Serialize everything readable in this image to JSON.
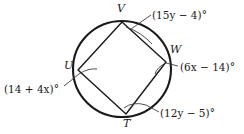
{
  "figure": {
    "shape": "cyclic quadrilateral UVWT inscribed in a circle",
    "stroke_color": "#1a1a1a",
    "background_color": "#ffffff"
  },
  "vertices": [
    {
      "name": "V",
      "label": "V",
      "x": 122,
      "y": 22
    },
    {
      "name": "W",
      "label": "W",
      "x": 166,
      "y": 62
    },
    {
      "name": "T",
      "label": "T",
      "x": 126,
      "y": 114
    },
    {
      "name": "U",
      "label": "U",
      "x": 78,
      "y": 70
    }
  ],
  "vertex_label_positions": [
    {
      "name": "V",
      "left": 117,
      "top": 3
    },
    {
      "name": "W",
      "left": 170,
      "top": 44
    },
    {
      "name": "T",
      "left": 123,
      "top": 118
    },
    {
      "name": "U",
      "left": 64,
      "top": 60
    }
  ],
  "angle_labels": [
    {
      "id": "angle-v",
      "text": "(15y − 4)°",
      "expression": "15y - 4",
      "vertex": "V",
      "left": 152,
      "top": 10
    },
    {
      "id": "angle-w",
      "text": "(6x − 14)°",
      "expression": "6x - 14",
      "vertex": "W",
      "left": 180,
      "top": 62
    },
    {
      "id": "angle-t",
      "text": "(12y − 5)°",
      "expression": "12y - 5",
      "vertex": "T",
      "left": 160,
      "top": 108
    },
    {
      "id": "angle-u",
      "text": "(14 + 4x)°",
      "expression": "14 + 4x",
      "vertex": "U",
      "left": 4,
      "top": 84
    }
  ],
  "circle": {
    "center_x": 122,
    "center_y": 69,
    "radius_x": 49,
    "radius_y": 48
  }
}
